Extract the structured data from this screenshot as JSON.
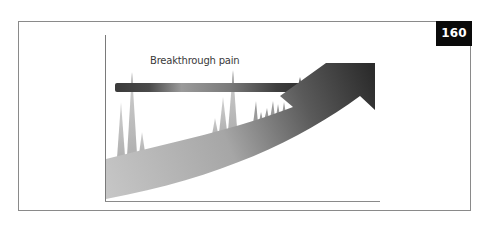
{
  "figure": {
    "number": "160",
    "label": "Breakthrough pain",
    "colors": {
      "frame_border": "#8a8a8a",
      "badge_background": "#0a0a0a",
      "badge_text": "#ffffff",
      "axis": "#7a7a7a",
      "spike": "#b4b4b4",
      "arrow_start": "#c4c4c4",
      "arrow_end": "#2e2e2e",
      "bar_dark": "#3c3c3c",
      "bar_light": "#a8a8a8",
      "label_text": "#3a3a3a"
    }
  }
}
